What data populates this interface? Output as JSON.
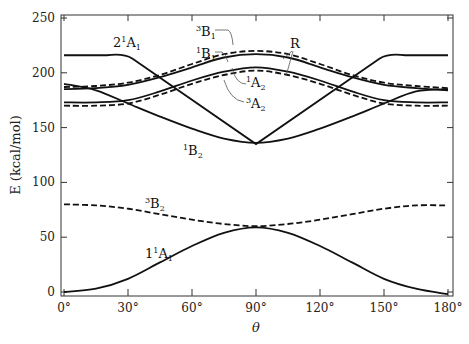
{
  "chart_data": {
    "type": "line",
    "title": "",
    "xlabel": "θ",
    "ylabel": "E   (kcal/mol)",
    "xlim": [
      0,
      180
    ],
    "ylim": [
      0,
      250
    ],
    "xticks": [
      0,
      30,
      60,
      90,
      120,
      150,
      180
    ],
    "xtick_labels": [
      "0°",
      "30°",
      "60°",
      "90°",
      "120°",
      "150°",
      "180°"
    ],
    "yticks": [
      0,
      50,
      100,
      150,
      200,
      250
    ],
    "ytick_labels": [
      "0",
      "50",
      "100",
      "150",
      "200",
      "250"
    ],
    "grid": false,
    "legend": "none (curves labeled directly)",
    "x": [
      0,
      15,
      30,
      45,
      60,
      75,
      90,
      105,
      120,
      135,
      150,
      165,
      180
    ],
    "series": [
      {
        "name": "1¹A₁",
        "style": "solid",
        "values": [
          0,
          3,
          12,
          27,
          42,
          54,
          59,
          54,
          42,
          27,
          12,
          3,
          -2
        ]
      },
      {
        "name": "³B₂",
        "style": "dashed",
        "values": [
          80,
          79,
          76,
          71,
          66,
          62,
          60,
          62,
          66,
          71,
          76,
          79,
          79
        ]
      },
      {
        "name": "¹B₂",
        "style": "solid",
        "values": [
          190,
          184,
          172,
          160,
          149,
          140,
          136,
          140,
          149,
          160,
          172,
          183,
          185
        ]
      },
      {
        "name": "2¹A₁",
        "style": "solid",
        "values": [
          216,
          215,
          217,
          196,
          172,
          154,
          135,
          154,
          172,
          196,
          216,
          215,
          216
        ]
      },
      {
        "name": "³A₂",
        "style": "dashed",
        "values": [
          170,
          170,
          172,
          180,
          190,
          198,
          202,
          198,
          190,
          180,
          172,
          170,
          170
        ]
      },
      {
        "name": "¹A₂",
        "style": "solid",
        "values": [
          173,
          173,
          175,
          183,
          193,
          201,
          205,
          201,
          193,
          183,
          175,
          173,
          173
        ]
      },
      {
        "name": "¹B₁",
        "style": "solid",
        "values": [
          185,
          186,
          189,
          196,
          205,
          214,
          217,
          214,
          205,
          196,
          189,
          186,
          184
        ]
      },
      {
        "name": "³B₁",
        "style": "dashed",
        "values": [
          187,
          188,
          191,
          198,
          208,
          217,
          220,
          217,
          208,
          198,
          191,
          188,
          186
        ]
      }
    ],
    "annotations": [
      {
        "text": "2¹A₁",
        "x": 25,
        "y": 228
      },
      {
        "text": "³B₁",
        "x": 82,
        "y": 238
      },
      {
        "text": "¹B₁",
        "x": 82,
        "y": 220
      },
      {
        "text": "R",
        "x": 112,
        "y": 225
      },
      {
        "text": "¹A₂",
        "x": 100,
        "y": 197
      },
      {
        "text": "³A₂",
        "x": 100,
        "y": 178
      },
      {
        "text": "¹B₂",
        "x": 55,
        "y": 134
      },
      {
        "text": "³B₂",
        "x": 43,
        "y": 84
      },
      {
        "text": "1¹A₁",
        "x": 45,
        "y": 42
      }
    ]
  },
  "labels": {
    "ylabel": "E   (kcal/mol)",
    "xlabel": "θ",
    "ann_2A1": {
      "main": "2",
      "sup": "1",
      "letter": "A",
      "sub": "1"
    },
    "ann_3B1": {
      "sup": "3",
      "letter": "B",
      "sub": "1"
    },
    "ann_1B1": {
      "sup": "1",
      "letter": "B",
      "sub": "1"
    },
    "ann_R": "R",
    "ann_1A2": {
      "sup": "1",
      "letter": "A",
      "sub": "2"
    },
    "ann_3A2": {
      "sup": "3",
      "letter": "A",
      "sub": "2"
    },
    "ann_1B2": {
      "sup": "1",
      "letter": "B",
      "sub": "2"
    },
    "ann_3B2": {
      "sup": "3",
      "letter": "B",
      "sub": "2"
    },
    "ann_1A1": {
      "main": "1",
      "sup": "1",
      "letter": "A",
      "sub": "1"
    }
  }
}
